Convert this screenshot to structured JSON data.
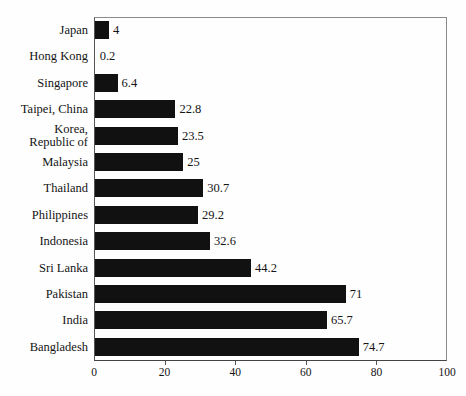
{
  "chart_data": {
    "type": "bar",
    "orientation": "horizontal",
    "title": "",
    "xlabel": "",
    "ylabel": "",
    "xlim": [
      0,
      100
    ],
    "xticks": [
      0,
      20,
      40,
      60,
      80,
      100
    ],
    "grid": false,
    "legend": null,
    "bar_color": "#111111",
    "background_color": "#fefefe",
    "categories": [
      "Japan",
      "Hong Kong",
      "Singapore",
      "Taipei, China",
      "Korea,\nRepublic of",
      "Malaysia",
      "Thailand",
      "Philippines",
      "Indonesia",
      "Sri Lanka",
      "Pakistan",
      "India",
      "Bangladesh"
    ],
    "values": [
      4,
      0.2,
      6.4,
      22.8,
      23.5,
      25,
      30.7,
      29.2,
      32.6,
      44.2,
      71,
      65.7,
      74.7
    ],
    "value_labels": [
      "4",
      "0.2",
      "6.4",
      "22.8",
      "23.5",
      "25",
      "30.7",
      "29.2",
      "32.6",
      "44.2",
      "71",
      "65.7",
      "74.7"
    ],
    "tick_labels": [
      "0",
      "20",
      "40",
      "60",
      "80",
      "100"
    ]
  }
}
